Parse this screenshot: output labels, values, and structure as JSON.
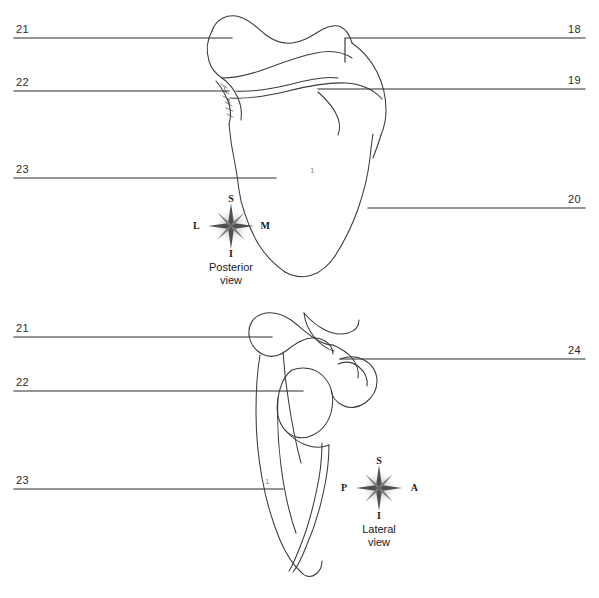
{
  "figure": {
    "line_color": "#2b2b2b",
    "art_color": "#3a3a3a"
  },
  "panels": [
    {
      "id": "posterior",
      "view_caption_line1": "Posterior",
      "view_caption_line2": "view",
      "compass": {
        "north": "S",
        "south": "I",
        "west": "L",
        "east": "M"
      },
      "body_number": "1",
      "labels": [
        {
          "number": "21",
          "side": "left"
        },
        {
          "number": "22",
          "side": "left"
        },
        {
          "number": "23",
          "side": "left"
        },
        {
          "number": "18",
          "side": "right"
        },
        {
          "number": "19",
          "side": "right"
        },
        {
          "number": "20",
          "side": "right"
        }
      ]
    },
    {
      "id": "lateral",
      "view_caption_line1": "Lateral",
      "view_caption_line2": "view",
      "compass": {
        "north": "S",
        "south": "I",
        "west": "P",
        "east": "A"
      },
      "body_number": "1",
      "labels": [
        {
          "number": "21",
          "side": "left"
        },
        {
          "number": "22",
          "side": "left"
        },
        {
          "number": "23",
          "side": "left"
        },
        {
          "number": "24",
          "side": "right"
        }
      ]
    }
  ],
  "footer": {
    "clipped_text": "......"
  }
}
